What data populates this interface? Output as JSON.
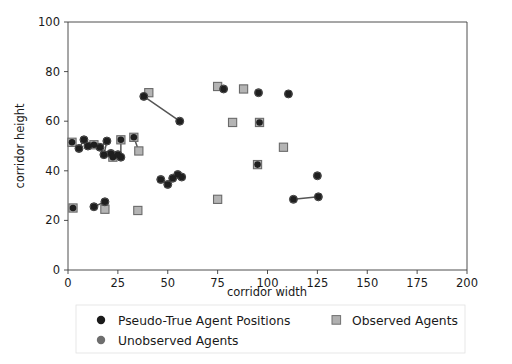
{
  "chart_data": {
    "type": "scatter",
    "title": "",
    "xlabel": "corridor width",
    "ylabel": "corridor height",
    "xlim": [
      0,
      200
    ],
    "ylim": [
      0,
      100
    ],
    "xticks": [
      0,
      25,
      50,
      75,
      100,
      125,
      150,
      175,
      200
    ],
    "yticks": [
      0,
      20,
      40,
      60,
      80,
      100
    ],
    "xtick_labels": [
      "0",
      "25",
      "50",
      "75",
      "100",
      "125",
      "150",
      "175",
      "200"
    ],
    "ytick_labels": [
      "0",
      "20",
      "40",
      "60",
      "80",
      "100"
    ],
    "grid": false,
    "legend_position": "below-axes",
    "series": [
      {
        "name": "Pseudo-True Agent Positions",
        "marker": "circle",
        "color": "#1a1a1a",
        "points": [
          [
            2.0,
            51.5
          ],
          [
            5.5,
            49.0
          ],
          [
            8.0,
            52.5
          ],
          [
            10.0,
            50.0
          ],
          [
            13.0,
            50.5
          ],
          [
            16.0,
            49.5
          ],
          [
            18.0,
            46.5
          ],
          [
            19.5,
            52.0
          ],
          [
            21.5,
            47.0
          ],
          [
            22.5,
            45.5
          ],
          [
            25.0,
            46.5
          ],
          [
            26.5,
            52.5
          ],
          [
            26.5,
            45.5
          ],
          [
            33.0,
            53.5
          ],
          [
            38.0,
            70.0
          ],
          [
            56.0,
            60.0
          ],
          [
            46.5,
            36.5
          ],
          [
            50.0,
            34.5
          ],
          [
            52.5,
            37.0
          ],
          [
            55.0,
            38.5
          ],
          [
            57.0,
            37.5
          ],
          [
            78.0,
            73.0
          ],
          [
            95.5,
            71.5
          ],
          [
            110.5,
            71.0
          ],
          [
            96.0,
            59.5
          ],
          [
            125.5,
            29.5
          ],
          [
            113.0,
            28.5
          ],
          [
            125.0,
            38.0
          ],
          [
            2.5,
            25.0
          ],
          [
            13.0,
            25.5
          ],
          [
            18.5,
            27.5
          ],
          [
            95.0,
            42.5
          ]
        ]
      },
      {
        "name": "Observed Agents",
        "marker": "square",
        "color": "#808080",
        "points": [
          [
            2.0,
            51.5
          ],
          [
            13.0,
            50.5
          ],
          [
            22.5,
            45.5
          ],
          [
            26.5,
            52.5
          ],
          [
            33.0,
            53.5
          ],
          [
            35.5,
            48.0
          ],
          [
            40.5,
            71.5
          ],
          [
            75.0,
            74.0
          ],
          [
            88.0,
            73.0
          ],
          [
            82.5,
            59.5
          ],
          [
            96.0,
            59.5
          ],
          [
            95.0,
            42.5
          ],
          [
            108.0,
            49.5
          ],
          [
            75.0,
            28.5
          ],
          [
            2.5,
            25.0
          ],
          [
            18.5,
            24.5
          ],
          [
            35.0,
            24.0
          ]
        ]
      },
      {
        "name": "Unobserved Agents",
        "marker": "circle-gray",
        "color": "#6e6e6e",
        "points": [
          [
            5.5,
            49.0
          ],
          [
            8.0,
            52.5
          ],
          [
            10.0,
            50.0
          ],
          [
            16.0,
            49.5
          ],
          [
            18.0,
            46.5
          ],
          [
            19.5,
            52.0
          ],
          [
            21.5,
            47.0
          ],
          [
            25.0,
            46.5
          ],
          [
            26.5,
            45.5
          ],
          [
            38.0,
            70.0
          ],
          [
            56.0,
            60.0
          ],
          [
            46.5,
            36.5
          ],
          [
            50.0,
            34.5
          ],
          [
            52.5,
            37.0
          ],
          [
            55.0,
            38.5
          ],
          [
            57.0,
            37.5
          ],
          [
            78.0,
            73.0
          ],
          [
            95.5,
            71.5
          ],
          [
            110.5,
            71.0
          ],
          [
            125.5,
            29.5
          ],
          [
            113.0,
            28.5
          ],
          [
            125.0,
            38.0
          ],
          [
            13.0,
            25.5
          ],
          [
            18.5,
            27.5
          ]
        ]
      }
    ],
    "connections": [
      [
        [
          38.0,
          70.0
        ],
        [
          56.0,
          60.0
        ]
      ],
      [
        [
          2.0,
          51.5
        ],
        [
          5.5,
          49.0
        ]
      ],
      [
        [
          5.5,
          49.0
        ],
        [
          8.0,
          52.5
        ]
      ],
      [
        [
          8.0,
          52.5
        ],
        [
          10.0,
          50.0
        ]
      ],
      [
        [
          13.0,
          50.5
        ],
        [
          16.0,
          49.5
        ]
      ],
      [
        [
          16.0,
          49.5
        ],
        [
          19.5,
          52.0
        ]
      ],
      [
        [
          19.5,
          52.0
        ],
        [
          18.0,
          46.5
        ]
      ],
      [
        [
          21.5,
          47.0
        ],
        [
          22.5,
          45.5
        ]
      ],
      [
        [
          22.5,
          45.5
        ],
        [
          25.0,
          46.5
        ]
      ],
      [
        [
          26.5,
          52.5
        ],
        [
          26.5,
          45.5
        ]
      ],
      [
        [
          46.5,
          36.5
        ],
        [
          50.0,
          34.5
        ]
      ],
      [
        [
          50.0,
          34.5
        ],
        [
          52.5,
          37.0
        ]
      ],
      [
        [
          55.0,
          38.5
        ],
        [
          57.0,
          37.5
        ]
      ],
      [
        [
          113.0,
          28.5
        ],
        [
          125.5,
          29.5
        ]
      ],
      [
        [
          13.0,
          25.5
        ],
        [
          18.5,
          27.5
        ]
      ],
      [
        [
          75.0,
          74.0
        ],
        [
          78.0,
          73.0
        ]
      ],
      [
        [
          95.5,
          71.5
        ],
        [
          95.5,
          71.5
        ]
      ],
      [
        [
          33.0,
          53.5
        ],
        [
          35.5,
          48.0
        ]
      ]
    ]
  },
  "axes": {
    "xlabel": "corridor width",
    "ylabel": "corridor height"
  },
  "legend": {
    "entries": [
      {
        "label": "Pseudo-True Agent Positions",
        "marker": "circle-dark"
      },
      {
        "label": "Observed Agents",
        "marker": "square-gray"
      },
      {
        "label": "Unobserved Agents",
        "marker": "circle-gray"
      }
    ]
  },
  "colors": {
    "marker_dark": "#1a1a1a",
    "marker_gray": "#6e6e6e",
    "square_gray": "#808080",
    "axis": "#3b3b3b",
    "connection": "#555555",
    "background": "#ffffff"
  }
}
